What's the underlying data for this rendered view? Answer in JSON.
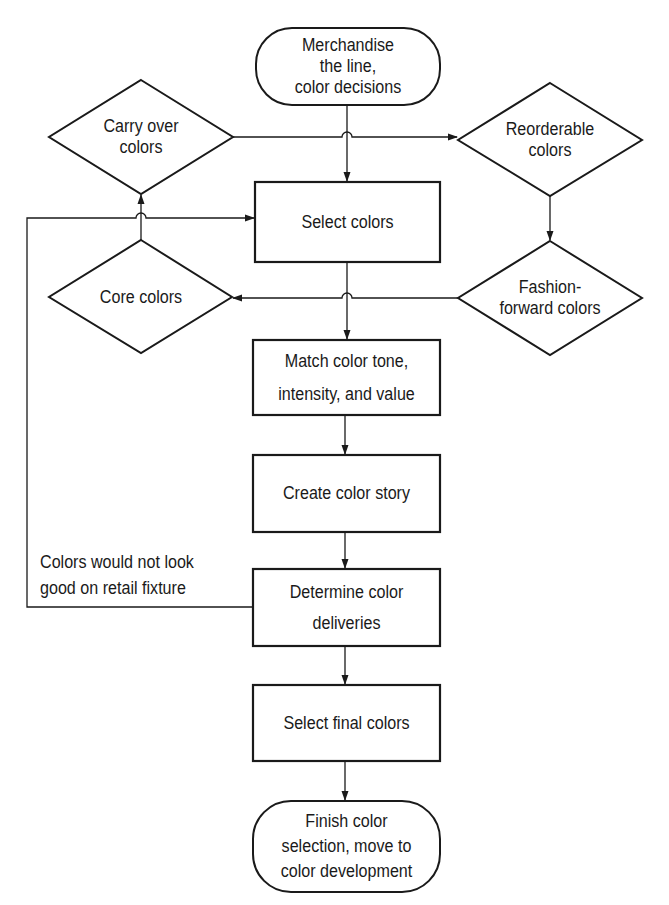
{
  "diagram": {
    "type": "flowchart",
    "nodes": {
      "start": {
        "shape": "terminal",
        "text": "Merchandise the line, color decisions",
        "lines": [
          "Merchandise",
          "the line,",
          "color decisions"
        ]
      },
      "carry_over": {
        "shape": "decision",
        "text": "Carry over colors",
        "lines": [
          "Carry over",
          "colors"
        ]
      },
      "reorderable": {
        "shape": "decision",
        "text": "Reorderable colors",
        "lines": [
          "Reorderable",
          "colors"
        ]
      },
      "select_colors": {
        "shape": "process",
        "text": "Select colors"
      },
      "core": {
        "shape": "decision",
        "text": "Core colors"
      },
      "fashion_forward": {
        "shape": "decision",
        "text": "Fashion-forward colors",
        "lines": [
          "Fashion-",
          "forward colors"
        ]
      },
      "match": {
        "shape": "process",
        "text": "Match color tone, intensity, and value",
        "lines": [
          "Match color tone,",
          "intensity, and value"
        ]
      },
      "story": {
        "shape": "process",
        "text": "Create color story"
      },
      "deliveries": {
        "shape": "process",
        "text": "Determine color deliveries",
        "lines": [
          "Determine color",
          "deliveries"
        ]
      },
      "final": {
        "shape": "process",
        "text": "Select final colors"
      },
      "finish": {
        "shape": "terminal",
        "text": "Finish color selection, move to color development",
        "lines": [
          "Finish color",
          "selection, move to",
          "color development"
        ]
      }
    },
    "loop_label": {
      "lines": [
        "Colors would not look",
        "good on retail fixture"
      ]
    },
    "edges": [
      {
        "from": "start",
        "to": "select_colors"
      },
      {
        "from": "carry_over",
        "to": "reorderable"
      },
      {
        "from": "reorderable",
        "to": "fashion_forward"
      },
      {
        "from": "fashion_forward",
        "to": "core"
      },
      {
        "from": "core",
        "to": "carry_over"
      },
      {
        "from": "select_colors",
        "to": "match"
      },
      {
        "from": "match",
        "to": "story"
      },
      {
        "from": "story",
        "to": "deliveries"
      },
      {
        "from": "deliveries",
        "to": "select_colors",
        "label": "Colors would not look good on retail fixture"
      },
      {
        "from": "deliveries",
        "to": "final"
      },
      {
        "from": "final",
        "to": "finish"
      }
    ],
    "colors": {
      "stroke": "#1a1a1a",
      "background": "#ffffff"
    }
  }
}
